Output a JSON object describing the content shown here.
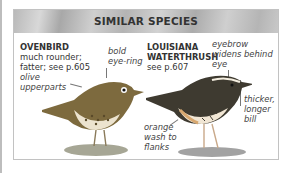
{
  "title": "SIMILAR SPECIES",
  "species": [
    {
      "name": "OVENBIRD",
      "desc_line1": "much rounder;",
      "desc_line2": "fatter; see p.605",
      "annotations": [
        {
          "line1": "bold",
          "line2": "eye-ring"
        },
        {
          "line1": "olive",
          "line2": "upperparts"
        }
      ]
    },
    {
      "name_line1": "LOUISIANA",
      "name_line2": "WATERTHRUSH",
      "desc_line1": "see p.607",
      "annotations": [
        {
          "line1": "eyebrow",
          "line2": "widens behind",
          "line3": "eye"
        },
        {
          "line1": "thicker,",
          "line2": "longer",
          "line3": "bill"
        },
        {
          "line1": "orange",
          "line2": "wash to",
          "line3": "flanks"
        }
      ]
    }
  ],
  "colors": {
    "header_bg": "#bdbdbd",
    "border": "#c2c2c2",
    "text": "#333333"
  }
}
